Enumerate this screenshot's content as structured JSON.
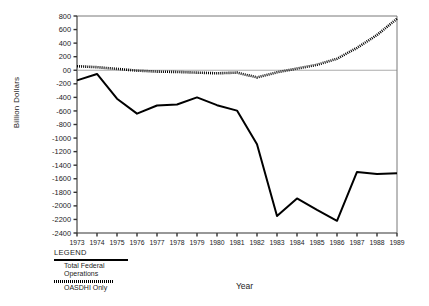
{
  "chart_data": {
    "type": "line",
    "title": "",
    "xlabel": "Year",
    "ylabel": "Billion Dollars",
    "x": [
      1973,
      1974,
      1975,
      1976,
      1977,
      1978,
      1979,
      1980,
      1981,
      1982,
      1983,
      1984,
      1985,
      1986,
      1987,
      1988,
      1989
    ],
    "xlim": [
      1973,
      1989
    ],
    "ylim": [
      -2400,
      800
    ],
    "ytick_step": 200,
    "yticks": [
      800,
      600,
      400,
      200,
      0,
      -200,
      -400,
      -600,
      -800,
      -1000,
      -1200,
      -1400,
      -1600,
      -1800,
      -2000,
      -2200,
      -2400
    ],
    "ytick_labels": [
      "800",
      "600",
      "400",
      "200",
      "00",
      "-200",
      "-400",
      "-600",
      "-800",
      "-1000",
      "-1200",
      "-1400",
      "-1600",
      "-1800",
      "-2000",
      "-2200",
      "-2400"
    ],
    "xtick_labels": [
      "1973",
      "1974",
      "1975",
      "1976",
      "1977",
      "1978",
      "1979",
      "1980",
      "1981",
      "1982",
      "1983",
      "1984",
      "1985",
      "1986",
      "1987",
      "1988",
      "1989"
    ],
    "grid": false,
    "zero_line": true,
    "legend_position": "below-left",
    "series": [
      {
        "name": "Total Federal Operations",
        "style": "solid",
        "color": "#000000",
        "values": [
          -150,
          -55,
          -420,
          -640,
          -520,
          -505,
          -400,
          -515,
          -595,
          -1090,
          -2150,
          -1890,
          -2060,
          -2220,
          -1500,
          -1530,
          -1520
        ]
      },
      {
        "name": "OASDHI Only",
        "style": "dotted",
        "color": "#000000",
        "values": [
          60,
          45,
          20,
          -5,
          -20,
          -25,
          -35,
          -45,
          -35,
          -105,
          -30,
          25,
          80,
          170,
          330,
          520,
          760
        ]
      }
    ]
  },
  "legend": {
    "title": "LEGEND",
    "entries": [
      {
        "label_line1": "Total Federal",
        "label_line2": "Operations",
        "style": "solid"
      },
      {
        "label_line1": "OASDHI Only",
        "label_line2": "",
        "style": "dotted"
      }
    ]
  }
}
